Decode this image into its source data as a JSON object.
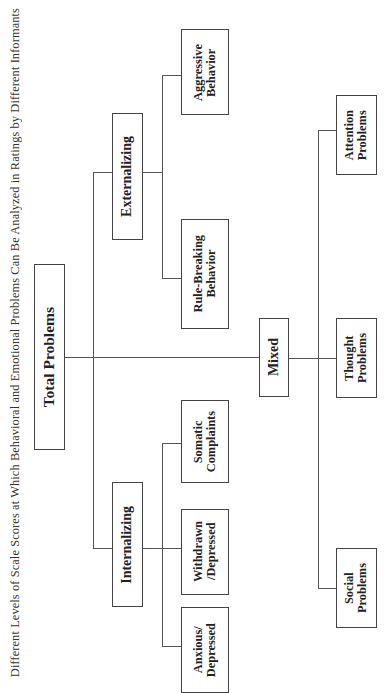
{
  "caption": "Different Levels of Scale Scores at Which Behavioral and Emotional Problems Can Be Analyzed in Ratings by Different Informants",
  "diagram": {
    "orientation": "rotated 90° counter-clockwise",
    "root": {
      "label": "Total Problems"
    },
    "groups": [
      {
        "label": "Externalizing",
        "children": [
          {
            "label": "Aggressive\nBehavior"
          },
          {
            "label": "Rule-Breaking\nBehavior"
          }
        ]
      },
      {
        "label": "Mixed",
        "children": [
          {
            "label": "Attention\nProblems"
          },
          {
            "label": "Thought\nProblems"
          },
          {
            "label": "Social\nProblems"
          }
        ]
      },
      {
        "label": "Internalizing",
        "children": [
          {
            "label": "Somatic\nComplaints"
          },
          {
            "label": "Withdrawn\n/Depressed"
          },
          {
            "label": "Anxious/\nDepressed"
          }
        ]
      }
    ]
  }
}
